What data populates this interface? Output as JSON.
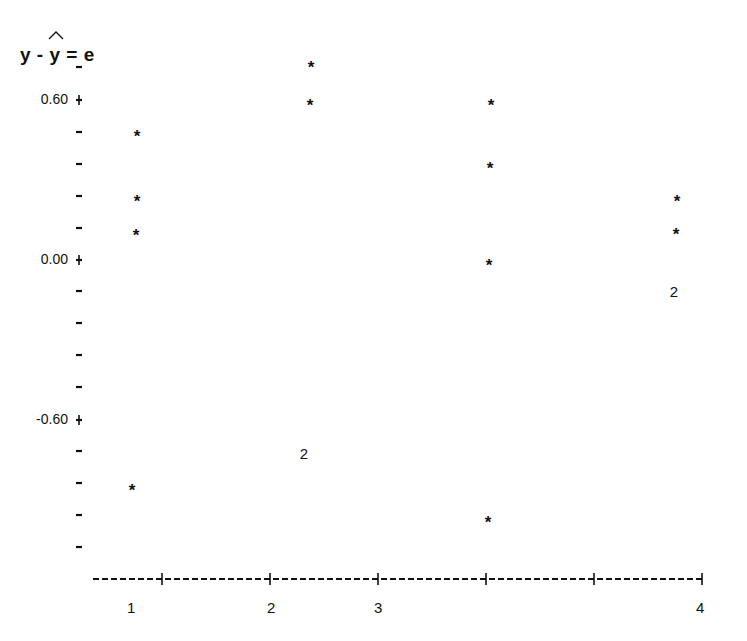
{
  "chart_data": {
    "type": "scatter",
    "title": "",
    "ylabel": "y - ŷ = e",
    "xlabel": "",
    "y_tick_labels": [
      "0.60",
      "0.00",
      "-0.60"
    ],
    "y_tick_values": [
      0.6,
      0.0,
      -0.6
    ],
    "y_minor_tick_step": 0.12,
    "ylim": [
      -1.08,
      0.72
    ],
    "x_tick_labels": [
      "1",
      "2",
      "3",
      "4"
    ],
    "grid": false,
    "legend": null,
    "symbol_note": "* = one observation, 2 = two coincident observations",
    "points": [
      {
        "x": 1.0,
        "y": 0.48,
        "symbol": "*"
      },
      {
        "x": 1.0,
        "y": 0.23,
        "symbol": "*"
      },
      {
        "x": 1.0,
        "y": 0.11,
        "symbol": "*"
      },
      {
        "x": 1.0,
        "y": -0.85,
        "symbol": "*"
      },
      {
        "x": 2.3,
        "y": 0.74,
        "symbol": "*"
      },
      {
        "x": 2.3,
        "y": 0.59,
        "symbol": "*"
      },
      {
        "x": 2.3,
        "y": -0.73,
        "symbol": "2"
      },
      {
        "x": 3.4,
        "y": 0.59,
        "symbol": "*"
      },
      {
        "x": 3.4,
        "y": 0.36,
        "symbol": "*"
      },
      {
        "x": 3.4,
        "y": -0.01,
        "symbol": "*"
      },
      {
        "x": 3.4,
        "y": -0.97,
        "symbol": "*"
      },
      {
        "x": 4.0,
        "y": 0.23,
        "symbol": "*"
      },
      {
        "x": 4.0,
        "y": 0.11,
        "symbol": "*"
      },
      {
        "x": 4.0,
        "y": -0.12,
        "symbol": "2"
      }
    ]
  },
  "axis": {
    "y_title_left": "y - ",
    "y_title_hat": "y",
    "y_title_right": " = e",
    "y_labels": [
      {
        "text": "0.60",
        "py": 100
      },
      {
        "text": "0.00",
        "py": 260
      },
      {
        "text": "-0.60",
        "py": 420
      }
    ],
    "x_labels": [
      {
        "text": "1",
        "px": 131
      },
      {
        "text": "2",
        "px": 271
      },
      {
        "text": "3",
        "px": 378
      },
      {
        "text": "4",
        "px": 700
      }
    ]
  },
  "markers": [
    {
      "px": 137,
      "py": 133,
      "t": "*"
    },
    {
      "px": 137,
      "py": 198,
      "t": "*"
    },
    {
      "px": 136,
      "py": 232,
      "t": "*"
    },
    {
      "px": 132,
      "py": 487,
      "t": "*"
    },
    {
      "px": 311,
      "py": 64,
      "t": "*"
    },
    {
      "px": 310,
      "py": 102,
      "t": "*"
    },
    {
      "px": 304,
      "py": 454,
      "t": "2"
    },
    {
      "px": 491,
      "py": 102,
      "t": "*"
    },
    {
      "px": 490,
      "py": 165,
      "t": "*"
    },
    {
      "px": 489,
      "py": 262,
      "t": "*"
    },
    {
      "px": 488,
      "py": 519,
      "t": "*"
    },
    {
      "px": 677,
      "py": 198,
      "t": "*"
    },
    {
      "px": 676,
      "py": 231,
      "t": "*"
    },
    {
      "px": 674,
      "py": 292,
      "t": "2"
    }
  ],
  "y_ticks_px": [
    67,
    100,
    132,
    164,
    196,
    228,
    260,
    291,
    323,
    355,
    387,
    420,
    451,
    483,
    515,
    547
  ],
  "y_major_ticks_px": [
    100,
    260,
    420
  ],
  "x_axis": {
    "y": 579,
    "x_start": 93,
    "x_end": 703,
    "plus_ticks_px": [
      162,
      270,
      378,
      486,
      594,
      702
    ]
  }
}
